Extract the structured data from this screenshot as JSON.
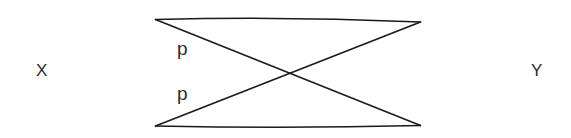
{
  "figure": {
    "kind": "bowtie-crossing-diagram",
    "background_color": "#ffffff",
    "stroke_color": "#1a1a1a",
    "label_color": "#2b2b2b",
    "width": 571,
    "height": 138
  },
  "labels": {
    "left_set": "X",
    "right_set": "Y",
    "upper_edge": "p",
    "lower_edge": "p"
  },
  "geometry": {
    "top_left": {
      "x": 155,
      "y": 19
    },
    "top_right": {
      "x": 421,
      "y": 22
    },
    "bottom_left": {
      "x": 155,
      "y": 126
    },
    "bottom_right": {
      "x": 421,
      "y": 126
    },
    "crossing_point": {
      "x": 288,
      "y": 73
    },
    "stroke_width": 1.6
  },
  "edges": [
    {
      "name": "top-horizontal-edge",
      "from": "top_left",
      "to": "top_right"
    },
    {
      "name": "bottom-horizontal-edge",
      "from": "bottom_left",
      "to": "bottom_right"
    },
    {
      "name": "descending-diagonal-edge",
      "from": "top_left",
      "to": "bottom_right"
    },
    {
      "name": "ascending-diagonal-edge",
      "from": "bottom_left",
      "to": "top_right"
    }
  ]
}
